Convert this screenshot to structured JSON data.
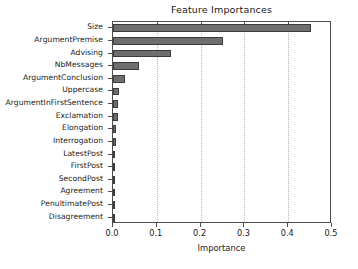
{
  "chart_data": {
    "type": "bar",
    "orientation": "horizontal",
    "title": "Feature Importances",
    "xlabel": "Importance",
    "ylabel": "",
    "xlim": [
      0.0,
      0.5
    ],
    "xticks": [
      0.0,
      0.1,
      0.2,
      0.3,
      0.4,
      0.5
    ],
    "xtick_labels": [
      "0.0",
      "0.1",
      "0.2",
      "0.3",
      "0.4",
      "0.5"
    ],
    "grid": "vertical-dotted",
    "legend": "none",
    "bar_color": "#6e6e6e",
    "bar_edge_color": "#3b3b3b",
    "categories": [
      "Size",
      "ArgumentPremise",
      "Advising",
      "NbMessages",
      "ArgumentConclusion",
      "Uppercase",
      "ArgumentInFirstSentence",
      "Exclamation",
      "Elongation",
      "Interrogation",
      "LatestPost",
      "FirstPost",
      "SecondPost",
      "Agreement",
      "PenultimatePost",
      "Disagreement"
    ],
    "values": [
      0.453,
      0.251,
      0.132,
      0.059,
      0.027,
      0.014,
      0.011,
      0.011,
      0.007,
      0.006,
      0.005,
      0.004,
      0.004,
      0.003,
      0.003,
      0.001
    ]
  }
}
